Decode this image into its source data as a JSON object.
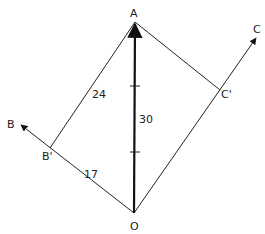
{
  "diagram": {
    "type": "vector-projection",
    "points": {
      "A": {
        "label": "A",
        "x": 135,
        "y": 22
      },
      "O": {
        "label": "O",
        "x": 134,
        "y": 213
      },
      "B1": {
        "label": "B'",
        "x": 50,
        "y": 148
      },
      "C1": {
        "label": "C'",
        "x": 220,
        "y": 90
      },
      "B": {
        "label": "B",
        "x": 20,
        "y": 124
      },
      "C": {
        "label": "C",
        "x": 257,
        "y": 37
      }
    },
    "labels": {
      "A": "A",
      "B": "B",
      "B_prime": "B'",
      "C": "C",
      "C_prime": "C'",
      "O": "O"
    },
    "lengths": {
      "OA": "30",
      "AB_prime": "24",
      "OB_prime": "17"
    },
    "tick_marks_on_OA": 2,
    "colors": {
      "line": "#222222",
      "background": "#ffffff"
    }
  }
}
